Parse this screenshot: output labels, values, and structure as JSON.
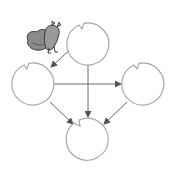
{
  "diagram": {
    "type": "directed-graph",
    "colors": {
      "node_stroke": "#a8a8a8",
      "edge": "#666666",
      "arrowhead": "#555555",
      "frog_body": "#8a8a8a",
      "frog_outline": "#3a3a3a"
    },
    "nodes": [
      {
        "id": "top",
        "cx": 88,
        "cy": 44,
        "r": 21
      },
      {
        "id": "left",
        "cx": 33,
        "cy": 84,
        "r": 21
      },
      {
        "id": "right",
        "cx": 143,
        "cy": 84,
        "r": 21
      },
      {
        "id": "bottom",
        "cx": 88,
        "cy": 138,
        "r": 21
      }
    ],
    "edges": [
      {
        "from": "top",
        "to": "left"
      },
      {
        "from": "top",
        "to": "bottom"
      },
      {
        "from": "left",
        "to": "right"
      },
      {
        "from": "left",
        "to": "bottom"
      },
      {
        "from": "right",
        "to": "bottom"
      }
    ],
    "frog": {
      "position": "left of top pad",
      "icon": "frog-icon"
    }
  }
}
